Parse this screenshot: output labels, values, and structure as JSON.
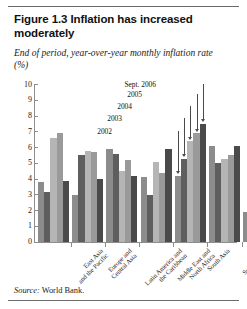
{
  "figure": {
    "title": "Figure 1.3  Inflation has increased moderately",
    "subtitle": "End of period, year-over-year monthly inflation rate (%)",
    "source_prefix": "Source:",
    "source_text": "World Bank."
  },
  "chart_data": {
    "type": "bar",
    "title": "Figure 1.3  Inflation has increased moderately",
    "subtitle": "End of period, year-over-year monthly inflation rate (%)",
    "xlabel": "",
    "ylabel": "End of period, year-over-year monthly inflation rate (%)",
    "ylim": [
      0,
      10
    ],
    "yticks": [
      0,
      1,
      2,
      3,
      4,
      5,
      6,
      7,
      8,
      9,
      10
    ],
    "ytick_labels": [
      "0",
      "1",
      "2",
      "3",
      "4",
      "5",
      "6",
      "7",
      "8",
      "9",
      "10"
    ],
    "grid": false,
    "legend": "annotations",
    "legend_position": "inline-callout",
    "categories": [
      "East Asia and the Pacific",
      "Europe and Central Asia",
      "Latin America and the Caribbean",
      "Middle East and North Africa",
      "South Asia",
      "Sub-Saharan Africa",
      "High-income countries"
    ],
    "series": [
      {
        "name": "2002",
        "color": "#8c8c8c",
        "values": [
          3.8,
          3.0,
          5.9,
          4.1,
          4.2,
          6.1,
          1.9
        ]
      },
      {
        "name": "2003",
        "color": "#5e5e5e",
        "values": [
          3.2,
          5.5,
          5.6,
          3.0,
          5.3,
          5.0,
          1.5
        ]
      },
      {
        "name": "2004",
        "color": "#b5b5b5",
        "values": [
          6.6,
          5.8,
          4.5,
          5.1,
          6.4,
          5.3,
          2.4
        ]
      },
      {
        "name": "2005",
        "color": "#9a9a9a",
        "values": [
          6.9,
          5.7,
          5.2,
          4.4,
          6.9,
          5.5,
          2.5
        ]
      },
      {
        "name": "Sept. 2006",
        "color": "#4a4a4a",
        "values": [
          3.9,
          4.0,
          4.2,
          5.9,
          7.5,
          6.1,
          2.8
        ]
      }
    ],
    "annotations": [
      {
        "label": "Sept. 2006",
        "points_to_series": "Sept. 2006",
        "points_to_category": "South Asia"
      },
      {
        "label": "2005",
        "points_to_series": "2005",
        "points_to_category": "South Asia"
      },
      {
        "label": "2004",
        "points_to_series": "2004",
        "points_to_category": "South Asia"
      },
      {
        "label": "2003",
        "points_to_series": "2003",
        "points_to_category": "South Asia"
      },
      {
        "label": "2002",
        "points_to_series": "2002",
        "points_to_category": "South Asia"
      }
    ]
  }
}
